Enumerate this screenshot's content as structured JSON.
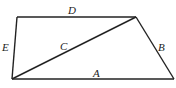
{
  "diagram": {
    "type": "quadrilateral-with-diagonal",
    "vertices": {
      "top_left": [
        17,
        17
      ],
      "top_right": [
        136,
        17
      ],
      "bottom_left": [
        12,
        79
      ],
      "bottom_right": [
        174,
        79
      ]
    },
    "edges": [
      {
        "label": "A",
        "from": "bottom_left",
        "to": "bottom_right"
      },
      {
        "label": "B",
        "from": "top_right",
        "to": "bottom_right"
      },
      {
        "label": "C",
        "from": "bottom_left",
        "to": "top_right"
      },
      {
        "label": "D",
        "from": "top_left",
        "to": "top_right"
      },
      {
        "label": "E",
        "from": "top_left",
        "to": "bottom_left"
      }
    ],
    "labels": {
      "A": "A",
      "B": "B",
      "C": "C",
      "D": "D",
      "E": "E"
    },
    "stroke_color": "#222222"
  }
}
